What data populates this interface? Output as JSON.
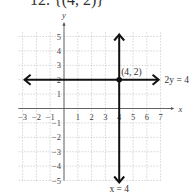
{
  "title": "12. {(4, 2)}",
  "chart_data": {
    "type": "line",
    "title": "12. {(4, 2)}",
    "xlabel": "x",
    "ylabel": "y",
    "xlim": [
      -3,
      7
    ],
    "ylim": [
      -5,
      5
    ],
    "grid": true,
    "x_ticks": [
      -3,
      -2,
      -1,
      1,
      2,
      3,
      4,
      5,
      6,
      7
    ],
    "y_ticks": [
      -5,
      -4,
      -3,
      -2,
      -1,
      1,
      2,
      3,
      4,
      5
    ],
    "series": [
      {
        "name": "2y = 4",
        "kind": "horizontal",
        "y": 2,
        "x": [
          -3,
          7
        ]
      },
      {
        "name": "x = 4",
        "kind": "vertical",
        "x": 4,
        "y": [
          -5,
          5
        ]
      }
    ],
    "points": [
      {
        "label": "(4, 2)",
        "x": 4,
        "y": 2
      }
    ],
    "annotations": [
      "(4, 2)",
      "2y = 4",
      "x = 4"
    ]
  },
  "labels": {
    "x_axis": "x",
    "y_axis": "y",
    "point": "(4, 2)",
    "line_h": "2y = 4",
    "line_v": "x = 4"
  }
}
